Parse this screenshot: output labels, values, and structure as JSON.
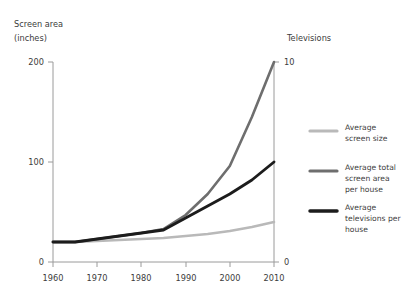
{
  "chart_data": {
    "type": "line",
    "title": "",
    "subtitle": "",
    "x": [
      1960,
      1965,
      1970,
      1975,
      1980,
      1985,
      1990,
      1995,
      2000,
      2005,
      2010
    ],
    "xlabel": "",
    "xlim": [
      1960,
      2010
    ],
    "xticks": [
      1960,
      1970,
      1980,
      1990,
      2000,
      2010
    ],
    "xticklabels": [
      "1960",
      "1970",
      "1980",
      "1990",
      "2000",
      "2010"
    ],
    "left_axis": {
      "label_line1": "Screen area",
      "label_line2": "(inches)",
      "ylim": [
        0,
        200
      ],
      "yticks": [
        0,
        100,
        200
      ],
      "yticklabels": [
        "0",
        "100",
        "200"
      ]
    },
    "right_axis": {
      "label": "Televisions",
      "ylim": [
        0,
        10
      ],
      "yticks": [
        0,
        10
      ],
      "yticklabels": [
        "0",
        "10"
      ]
    },
    "grid": false,
    "legend_position": "right",
    "series": [
      {
        "name": "Average screen size",
        "legend_line1": "Average",
        "legend_line2": "screen size",
        "legend_line3": "",
        "color": "#b9b9b9",
        "width": 2.6,
        "axis": "left",
        "values": [
          20,
          20,
          21,
          22,
          23,
          24,
          26,
          28,
          31,
          35,
          40
        ]
      },
      {
        "name": "Average total screen area per house",
        "legend_line1": "Average total",
        "legend_line2": "screen area",
        "legend_line3": "per house",
        "color": "#6e6e6e",
        "width": 2.6,
        "axis": "left",
        "values": [
          20,
          20,
          23,
          26,
          29,
          33,
          47,
          68,
          96,
          145,
          200
        ]
      },
      {
        "name": "Average televisions per house",
        "legend_line1": "Average",
        "legend_line2": "televisions per",
        "legend_line3": "house",
        "color": "#1c1c1c",
        "width": 2.9,
        "axis": "right",
        "values": [
          1.0,
          1.0,
          1.15,
          1.3,
          1.45,
          1.6,
          2.2,
          2.8,
          3.4,
          4.1,
          5.0
        ]
      }
    ]
  }
}
